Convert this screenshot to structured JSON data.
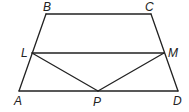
{
  "diagram": {
    "type": "geometry",
    "stroke_color": "#222222",
    "points": {
      "A": {
        "label": "A",
        "x": 19,
        "y": 91,
        "lx": 14,
        "ly": 105
      },
      "B": {
        "label": "B",
        "x": 46,
        "y": 14,
        "lx": 43,
        "ly": 11
      },
      "C": {
        "label": "C",
        "x": 151,
        "y": 14,
        "lx": 145,
        "ly": 11
      },
      "D": {
        "label": "D",
        "x": 178,
        "y": 91,
        "lx": 173,
        "ly": 105
      },
      "L": {
        "label": "L",
        "x": 32,
        "y": 53,
        "lx": 21,
        "ly": 57
      },
      "M": {
        "label": "M",
        "x": 164,
        "y": 53,
        "lx": 168,
        "ly": 57
      },
      "P": {
        "label": "P",
        "x": 98,
        "y": 91,
        "lx": 93,
        "ly": 106
      }
    },
    "segments": [
      [
        "A",
        "B"
      ],
      [
        "B",
        "C"
      ],
      [
        "C",
        "D"
      ],
      [
        "A",
        "D"
      ],
      [
        "L",
        "M"
      ],
      [
        "L",
        "P"
      ],
      [
        "M",
        "P"
      ]
    ]
  }
}
